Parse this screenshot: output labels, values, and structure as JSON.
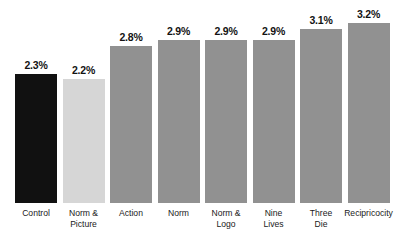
{
  "chart_data": {
    "type": "bar",
    "title": "",
    "subtitle": "",
    "xlabel": "",
    "ylabel": "",
    "ylim": [
      0,
      3.4
    ],
    "grid": false,
    "legend": false,
    "categories": [
      "Control",
      "Norm &\nPicture",
      "Action",
      "Norm",
      "Norm &\nLogo",
      "Nine\nLives",
      "Three\nDie",
      "Recipricocity"
    ],
    "values": [
      2.3,
      2.2,
      2.8,
      2.9,
      2.9,
      2.9,
      3.1,
      3.2
    ],
    "value_labels": [
      "2.3%",
      "2.2%",
      "2.8%",
      "2.9%",
      "2.9%",
      "2.9%",
      "3.1%",
      "3.2%"
    ],
    "bar_colors": [
      "#111111",
      "#d6d6d6",
      "#919191",
      "#919191",
      "#919191",
      "#919191",
      "#919191",
      "#919191"
    ]
  },
  "colors": {
    "background": "#ffffff",
    "dark_bar": "#111111",
    "light_bar": "#d6d6d6",
    "default_bar": "#919191",
    "text": "#1a1a1a"
  }
}
